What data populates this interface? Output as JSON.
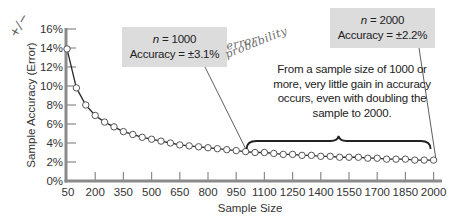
{
  "chart_data": {
    "type": "line",
    "title": "",
    "xlabel": "Sample Size",
    "ylabel": "Sample Accuracy (Error)",
    "xlim": [
      50,
      2000
    ],
    "ylim": [
      0,
      16
    ],
    "grid": false,
    "legend": null,
    "x_ticks": [
      "50",
      "200",
      "350",
      "500",
      "650",
      "800",
      "950",
      "1100",
      "1250",
      "1400",
      "1550",
      "1700",
      "1850",
      "2000"
    ],
    "y_ticks": [
      "0%",
      "2%",
      "4%",
      "6%",
      "8%",
      "10%",
      "12%",
      "14%",
      "16%"
    ],
    "series": [
      {
        "name": "Sample accuracy (error, %)",
        "marker": "open-circle",
        "x": [
          50,
          100,
          150,
          200,
          250,
          300,
          350,
          400,
          450,
          500,
          550,
          600,
          650,
          700,
          750,
          800,
          850,
          900,
          950,
          1000,
          1050,
          1100,
          1150,
          1200,
          1250,
          1300,
          1350,
          1400,
          1450,
          1500,
          1550,
          1600,
          1650,
          1700,
          1750,
          1800,
          1850,
          1900,
          1950,
          2000
        ],
        "values": [
          13.9,
          9.8,
          8.0,
          6.9,
          6.2,
          5.7,
          5.2,
          4.9,
          4.6,
          4.4,
          4.2,
          4.0,
          3.8,
          3.7,
          3.6,
          3.5,
          3.4,
          3.3,
          3.2,
          3.1,
          3.0,
          3.0,
          2.9,
          2.8,
          2.8,
          2.7,
          2.7,
          2.6,
          2.6,
          2.5,
          2.5,
          2.5,
          2.4,
          2.4,
          2.3,
          2.3,
          2.3,
          2.2,
          2.2,
          2.2
        ]
      }
    ],
    "annotations": [
      {
        "id": "callout-1000",
        "line1": "n = 1000",
        "line2": "Accuracy = ±3.1%",
        "points_to": [
          1000,
          3.1
        ]
      },
      {
        "id": "callout-2000",
        "line1": "n = 2000",
        "line2": "Accuracy = ±2.2%",
        "points_to": [
          2000,
          2.2
        ]
      },
      {
        "id": "note",
        "text": "From a sample size of 1000 or more, very little gain in accuracy occurs, even with doubling the sample to 2000.",
        "brace_range": [
          1000,
          2000
        ]
      }
    ],
    "handwritten": [
      "+/−",
      "error",
      "probability"
    ]
  },
  "callouts": {
    "c1000": {
      "n_label": "n",
      "n_value": " = 1000",
      "accuracy": "Accuracy = ±3.1%"
    },
    "c2000": {
      "n_label": "n",
      "n_value": " = 2000",
      "accuracy": "Accuracy = ±2.2%"
    }
  },
  "note_text": "From a sample size of 1000 or more, very little gain in accuracy occurs, even with doubling the sample to 2000.",
  "handwriting": {
    "pm": "+/−",
    "error": "error",
    "probability": "probability"
  },
  "colors": {
    "line": "#2a2a2a",
    "axis": "#8a8a8a",
    "callout_bg": "#dcdcdc",
    "text": "#222222"
  }
}
